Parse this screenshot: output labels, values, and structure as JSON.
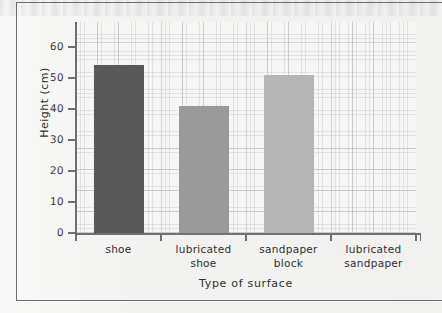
{
  "figure": {
    "background_color": "#f1f1ef",
    "frame_color": "#6d6d6d",
    "axis_color": "#6f6f6f",
    "grid_color": "#b0b6be"
  },
  "chart_data": {
    "type": "bar",
    "title": "",
    "subtitle": "",
    "xlabel": "Type of surface",
    "ylabel": "Height (cm)",
    "categories": [
      "shoe",
      "lubricated shoe",
      "sandpaper block",
      "lubricated sandpaper"
    ],
    "category_lines": [
      [
        "shoe"
      ],
      [
        "lubricated",
        "shoe"
      ],
      [
        "sandpaper",
        "block"
      ],
      [
        "lubricated",
        "sandpaper"
      ]
    ],
    "values": [
      54,
      41,
      51,
      0
    ],
    "bar_colors": [
      "#585858",
      "#9a9a9a",
      "#b5b5b5",
      "#eeeeec"
    ],
    "ylim": [
      0,
      68
    ],
    "yticks": [
      0,
      10,
      20,
      30,
      40,
      50,
      60
    ],
    "ytick_labels": [
      "0",
      "10",
      "20",
      "30",
      "40",
      "50",
      "60"
    ],
    "grid": true,
    "grid_style": "graph-paper",
    "legend": "none",
    "legend_position": "none",
    "annotations": []
  }
}
